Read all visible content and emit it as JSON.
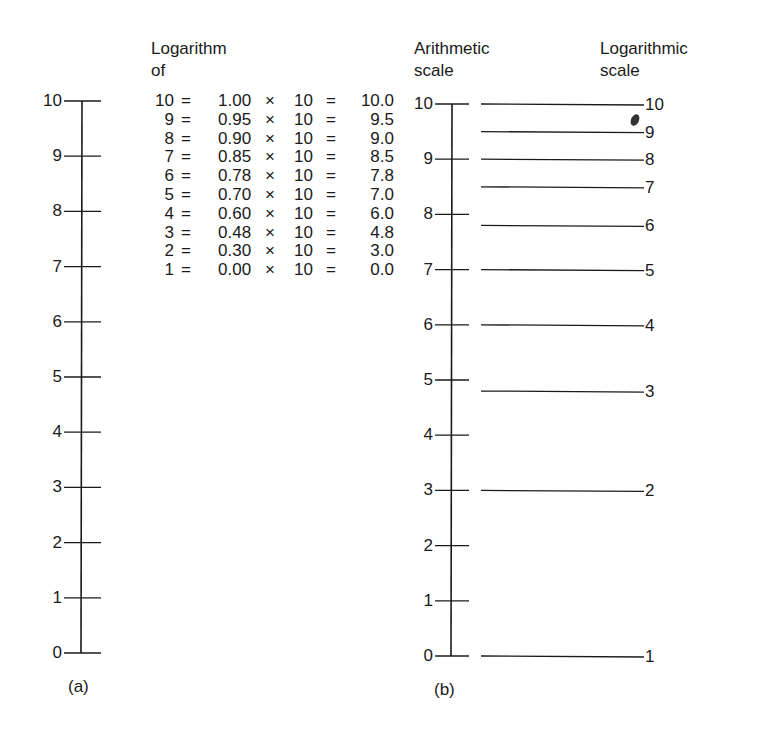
{
  "diagram_a": {
    "caption": "(a)",
    "axis": {
      "min": 0,
      "max": 10,
      "ticks": [
        "0",
        "1",
        "2",
        "3",
        "4",
        "5",
        "6",
        "7",
        "8",
        "9",
        "10"
      ]
    },
    "table": {
      "header_line1": "Logarithm",
      "header_line2": "of",
      "rows": [
        {
          "n": "10",
          "eq": "=",
          "log": "1.00",
          "times": "×",
          "ten": "10",
          "eq2": "=",
          "result": "10.0"
        },
        {
          "n": "9",
          "eq": "=",
          "log": "0.95",
          "times": "×",
          "ten": "10",
          "eq2": "=",
          "result": "9.5"
        },
        {
          "n": "8",
          "eq": "=",
          "log": "0.90",
          "times": "×",
          "ten": "10",
          "eq2": "=",
          "result": "9.0"
        },
        {
          "n": "7",
          "eq": "=",
          "log": "0.85",
          "times": "×",
          "ten": "10",
          "eq2": "=",
          "result": "8.5"
        },
        {
          "n": "6",
          "eq": "=",
          "log": "0.78",
          "times": "×",
          "ten": "10",
          "eq2": "=",
          "result": "7.8"
        },
        {
          "n": "5",
          "eq": "=",
          "log": "0.70",
          "times": "×",
          "ten": "10",
          "eq2": "=",
          "result": "7.0"
        },
        {
          "n": "4",
          "eq": "=",
          "log": "0.60",
          "times": "×",
          "ten": "10",
          "eq2": "=",
          "result": "6.0"
        },
        {
          "n": "3",
          "eq": "=",
          "log": "0.48",
          "times": "×",
          "ten": "10",
          "eq2": "=",
          "result": "4.8"
        },
        {
          "n": "2",
          "eq": "=",
          "log": "0.30",
          "times": "×",
          "ten": "10",
          "eq2": "=",
          "result": "3.0"
        },
        {
          "n": "1",
          "eq": "=",
          "log": "0.00",
          "times": "×",
          "ten": "10",
          "eq2": "=",
          "result": "0.0"
        }
      ]
    }
  },
  "diagram_b": {
    "caption": "(b)",
    "arithmetic_header_line1": "Arithmetic",
    "arithmetic_header_line2": "scale",
    "log_header_line1": "Logarithmic",
    "log_header_line2": "scale",
    "axis": {
      "min": 0,
      "max": 10,
      "ticks": [
        "0",
        "1",
        "2",
        "3",
        "4",
        "5",
        "6",
        "7",
        "8",
        "9",
        "10"
      ]
    },
    "log_marks": [
      {
        "label": "10",
        "position": 10.0
      },
      {
        "label": "9",
        "position": 9.5
      },
      {
        "label": "8",
        "position": 9.0
      },
      {
        "label": "7",
        "position": 8.5
      },
      {
        "label": "6",
        "position": 7.8
      },
      {
        "label": "5",
        "position": 7.0
      },
      {
        "label": "4",
        "position": 6.0
      },
      {
        "label": "3",
        "position": 4.8
      },
      {
        "label": "2",
        "position": 3.0
      },
      {
        "label": "1",
        "position": 0.0
      }
    ]
  },
  "colors": {
    "ink": "#1a1a1a",
    "background": "#ffffff"
  }
}
